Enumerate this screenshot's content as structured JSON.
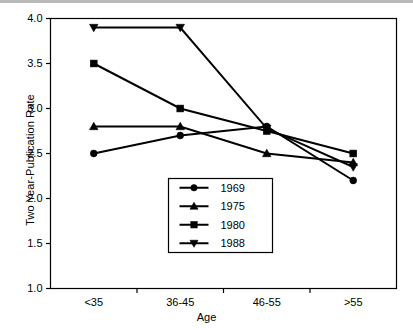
{
  "chart_data": {
    "type": "line",
    "title": "",
    "xlabel": "Age",
    "ylabel": "Two Year-Publication Rate",
    "categories": [
      "<35",
      "36-45",
      "46-55",
      ">55"
    ],
    "ylim": [
      1.0,
      4.0
    ],
    "yticks": [
      "1.0",
      "1.5",
      "2.0",
      "2.5",
      "3.0",
      "3.5",
      "4.0"
    ],
    "ytick_values": [
      1.0,
      1.5,
      2.0,
      2.5,
      3.0,
      3.5,
      4.0
    ],
    "grid": false,
    "legend_position": "lower-center",
    "series": [
      {
        "name": "1969",
        "marker": "circle",
        "values": [
          2.5,
          2.7,
          2.8,
          2.2
        ]
      },
      {
        "name": "1975",
        "marker": "triangle-up",
        "values": [
          2.8,
          2.8,
          2.5,
          2.4
        ]
      },
      {
        "name": "1980",
        "marker": "square",
        "values": [
          3.5,
          3.0,
          2.75,
          2.5
        ]
      },
      {
        "name": "1988",
        "marker": "triangle-down",
        "values": [
          3.9,
          3.9,
          2.78,
          2.35
        ]
      }
    ],
    "line_color": "#000000",
    "axis_color": "#000000",
    "background": "#ffffff"
  }
}
